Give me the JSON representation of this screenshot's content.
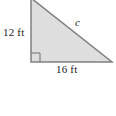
{
  "figure": {
    "kind": "right-triangle-diagram",
    "background_color": "#ffffff",
    "shape": {
      "fill_color": "#dedede",
      "stroke_color": "#808080",
      "stroke_width": 1.5,
      "vertices": [
        {
          "name": "apex",
          "x": 31,
          "y": -2
        },
        {
          "name": "right-angle",
          "x": 31,
          "y": 62
        },
        {
          "name": "base-right",
          "x": 112,
          "y": 62
        }
      ],
      "right_angle_marker": {
        "x": 31,
        "y": 53,
        "size": 9,
        "stroke_color": "#808080"
      }
    },
    "labels": {
      "vertical_leg": "12 ft",
      "horizontal_leg": "16 ft",
      "hypotenuse": "c"
    }
  },
  "chart_data": {
    "type": "diagram",
    "title": "",
    "subtitle": "",
    "shape": "right triangle",
    "sides": [
      {
        "name": "vertical leg",
        "label": "12 ft",
        "value": 12,
        "unit": "ft",
        "position": "left"
      },
      {
        "name": "horizontal leg",
        "label": "16 ft",
        "value": 16,
        "unit": "ft",
        "position": "bottom"
      },
      {
        "name": "hypotenuse",
        "label": "c",
        "value": null,
        "unit": "ft",
        "position": "upper-right"
      }
    ],
    "annotations": [
      "right angle marker at lower-left vertex"
    ],
    "legend": null,
    "grid": false
  }
}
